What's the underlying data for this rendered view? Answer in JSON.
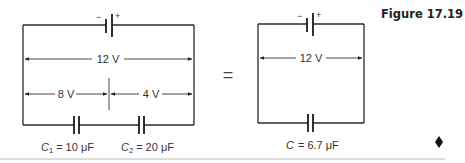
{
  "figure": {
    "label": "Figure 17.19",
    "end_marker": "♦"
  },
  "left_circuit": {
    "battery": {
      "neg_sign": "−",
      "pos_sign": "+"
    },
    "total_voltage": "12 V",
    "v1": "8 V",
    "v2": "4 V",
    "c1": {
      "symbol": "C",
      "subscript": "1",
      "value": "= 10 μF"
    },
    "c2": {
      "symbol": "C",
      "subscript": "2",
      "value": "= 20 μF"
    }
  },
  "equals": "=",
  "right_circuit": {
    "battery": {
      "neg_sign": "−",
      "pos_sign": "+"
    },
    "total_voltage": "12 V",
    "c": {
      "symbol": "C",
      "value": "= 6.7 μF"
    }
  },
  "colors": {
    "line": "#2a2a2a",
    "text": "#333333",
    "background": "#ffffff"
  }
}
